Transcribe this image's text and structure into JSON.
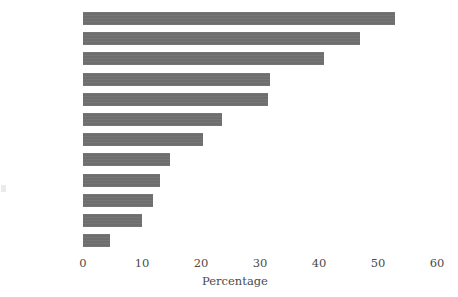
{
  "chart_data": {
    "type": "bar",
    "orientation": "horizontal",
    "title": "",
    "xlabel": "Percentage",
    "ylabel": "",
    "categories": [
      "Cuba",
      "Sweden",
      "Spain",
      "UK",
      "Germany",
      "US",
      "Pakistan",
      "Brazil",
      "Hungary",
      "India",
      "Japan",
      "Kuwait"
    ],
    "values": [
      52.9,
      47.0,
      40.8,
      31.7,
      31.4,
      23.6,
      20.3,
      14.7,
      13.0,
      11.9,
      10.0,
      4.6
    ],
    "xlim": [
      0,
      60
    ],
    "xticks": [
      0,
      10,
      20,
      30,
      40,
      50,
      60
    ],
    "xtick_labels": [
      "0",
      "10",
      "20",
      "30",
      "40",
      "50",
      "60"
    ],
    "grid": false,
    "legend": null,
    "bar_color": "#6e6e6e",
    "text_color": "#4a4a4a",
    "background": "#ffffff"
  }
}
